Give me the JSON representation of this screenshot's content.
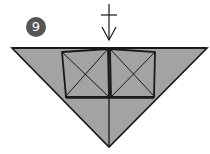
{
  "diagram": {
    "step_number": "9",
    "colors": {
      "paper_fill": "#a3a3a3",
      "line": "#1a1a1a",
      "badge_bg": "#555555",
      "badge_text": "#ffffff"
    },
    "elements": {
      "arrow": "valley-fold-down-arrow",
      "shape": "inverted-triangle",
      "flaps": [
        "left-square-flap-x-creases",
        "right-square-flap-x-creases"
      ],
      "center_crease": "vertical-center-line"
    }
  }
}
